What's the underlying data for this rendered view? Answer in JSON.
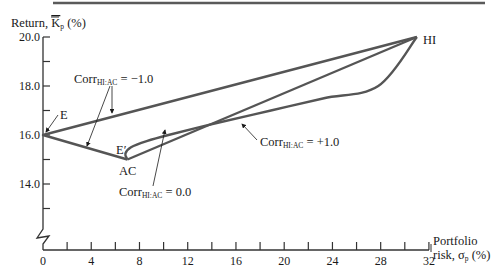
{
  "chart_data": {
    "type": "line",
    "title": "",
    "xlabel": "Portfolio risk, σp (%)",
    "xlabel_lines": [
      "Portfolio",
      "risk, σp (%)"
    ],
    "ylabel": "Return, K̄p (%)",
    "xlim": [
      0,
      32
    ],
    "ylim": [
      12.0,
      20.0
    ],
    "y_axis_break": true,
    "grid": false,
    "legend": "none",
    "x_ticks": [
      0,
      2,
      4,
      6,
      8,
      10,
      12,
      14,
      16,
      18,
      20,
      22,
      24,
      26,
      28,
      30,
      32
    ],
    "x_tick_labels": [
      {
        "value": 0,
        "label": "0"
      },
      {
        "value": 4,
        "label": "4"
      },
      {
        "value": 8,
        "label": "8"
      },
      {
        "value": 12,
        "label": "12"
      },
      {
        "value": 16,
        "label": "16"
      },
      {
        "value": 20,
        "label": "20"
      },
      {
        "value": 24,
        "label": "24"
      },
      {
        "value": 28,
        "label": "28"
      },
      {
        "value": 32,
        "label": "32"
      }
    ],
    "y_ticks": [
      13.0,
      14.0,
      15.0,
      16.0,
      17.0,
      18.0,
      19.0,
      20.0
    ],
    "y_tick_labels": [
      {
        "value": 14.0,
        "label": "14.0"
      },
      {
        "value": 16.0,
        "label": "16.0"
      },
      {
        "value": 18.0,
        "label": "18.0"
      },
      {
        "value": 20.0,
        "label": "20.0"
      }
    ],
    "points": [
      {
        "name": "HI",
        "label": "HI",
        "x": 31.0,
        "y": 20.0
      },
      {
        "name": "AC",
        "label": "AC",
        "x": 7.0,
        "y": 15.0
      },
      {
        "name": "E",
        "label": "E",
        "x": 0.0,
        "y": 16.0
      },
      {
        "name": "E_prime",
        "label": "E′",
        "x": 6.8,
        "y": 15.24
      }
    ],
    "series": [
      {
        "name": "Corr HI:AC = −1.0",
        "correlation": -1.0,
        "x": [
          7.0,
          0.0,
          31.0
        ],
        "y": [
          15.0,
          16.0,
          20.0
        ]
      },
      {
        "name": "Corr HI:AC = 0.0",
        "correlation": 0.0,
        "x": [
          7.0,
          6.83,
          7.3,
          8.6,
          10.4,
          14.5,
          18.9,
          23.3,
          27.8,
          31.0
        ],
        "y": [
          15.0,
          15.24,
          15.5,
          15.75,
          16.0,
          16.5,
          17.0,
          17.5,
          18.0,
          20.0
        ]
      },
      {
        "name": "Corr HI:AC = +1.0",
        "correlation": 1.0,
        "x": [
          7.0,
          31.0
        ],
        "y": [
          15.0,
          20.0
        ]
      }
    ],
    "annotations": [
      {
        "text": "Corr",
        "subscript": "HI:AC",
        "suffix": " = −1.0",
        "targets": [
          "E–AC segment",
          "E–HI segment"
        ]
      },
      {
        "text": "Corr",
        "subscript": "HI:AC",
        "suffix": " = 0.0",
        "targets": [
          "corr 0 curve"
        ]
      },
      {
        "text": "Corr",
        "subscript": "HI:AC",
        "suffix": " = +1.0",
        "targets": [
          "AC–HI line"
        ]
      }
    ],
    "line_color": "#555555",
    "text_color": "#1a1a1a"
  },
  "labels": {
    "ylabel_main": "Return, ",
    "ylabel_symbol": "K",
    "ylabel_sub": "p",
    "ylabel_unit": " (%)",
    "xlabel_line1": "Portfolio",
    "xlabel_line2_main": "risk, σ",
    "xlabel_line2_sub": "p",
    "xlabel_line2_unit": " (%)",
    "corr_word": "Corr",
    "corr_sub": "HI:AC",
    "corr_neg": " = −1.0",
    "corr_zero": " = 0.0",
    "corr_pos": " = +1.0",
    "point_E": "E",
    "point_Eprime": "E′",
    "point_AC": "AC",
    "point_HI": "HI"
  }
}
